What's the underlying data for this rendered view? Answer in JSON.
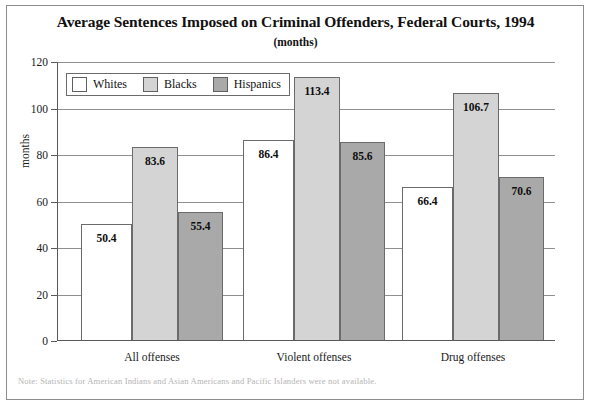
{
  "chart_data": {
    "type": "bar",
    "title": "Average Sentences Imposed on Criminal Offenders, Federal Courts, 1994",
    "subtitle": "(months)",
    "xlabel": "",
    "ylabel": "months",
    "ylim": [
      0,
      120
    ],
    "ytick_step": 20,
    "yticks": [
      0,
      20,
      40,
      60,
      80,
      100,
      120
    ],
    "grid": true,
    "legend_position": "top-left-inside",
    "categories": [
      "All offenses",
      "Violent offenses",
      "Drug offenses"
    ],
    "series": [
      {
        "name": "Whites",
        "color": "#ffffff",
        "values": [
          50.4,
          86.4,
          66.4
        ],
        "labels": [
          "50.4",
          "86.4",
          "66.4"
        ]
      },
      {
        "name": "Blacks",
        "color": "#d4d4d4",
        "values": [
          83.6,
          113.4,
          106.7
        ],
        "labels": [
          "83.6",
          "113.4",
          "106.7"
        ]
      },
      {
        "name": "Hispanics",
        "color": "#a9a9a9",
        "values": [
          55.4,
          85.6,
          70.6
        ],
        "labels": [
          "55.4",
          "85.6",
          "70.6"
        ]
      }
    ],
    "note": "Note: Statistics for American Indians and Asian Americans and Pacific Islanders were not available."
  },
  "yaxis": {
    "ticks": [
      {
        "label": "120",
        "value": 120
      },
      {
        "label": "100",
        "value": 100
      },
      {
        "label": "80",
        "value": 80
      },
      {
        "label": "60",
        "value": 60
      },
      {
        "label": "40",
        "value": 40
      },
      {
        "label": "20",
        "value": 20
      },
      {
        "label": "0",
        "value": 0
      }
    ],
    "title": "months"
  },
  "legend": {
    "items": [
      {
        "label": "Whites",
        "swatch": "white-swatch"
      },
      {
        "label": "Blacks",
        "swatch": "light-gray-swatch"
      },
      {
        "label": "Hispanics",
        "swatch": "dark-gray-swatch"
      }
    ]
  },
  "footnote": {
    "text": "Note: Statistics for American Indians and Asian Americans and Pacific Islanders were not available."
  }
}
